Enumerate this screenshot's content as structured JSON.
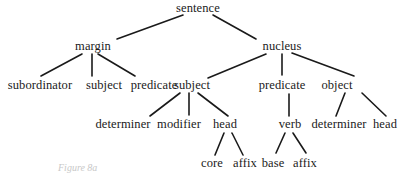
{
  "diagram": {
    "type": "tree",
    "nodes": [
      {
        "id": "n0",
        "label": "sentence",
        "x": 198,
        "y": 8
      },
      {
        "id": "n1",
        "label": "margin",
        "x": 93,
        "y": 46
      },
      {
        "id": "n2",
        "label": "nucleus",
        "x": 282,
        "y": 46
      },
      {
        "id": "n3",
        "label": "subordinator",
        "x": 40,
        "y": 85
      },
      {
        "id": "n4",
        "label": "subject",
        "x": 104,
        "y": 85
      },
      {
        "id": "n5",
        "label": "predicate",
        "x": 154,
        "y": 85
      },
      {
        "id": "n6",
        "label": "subject",
        "x": 192,
        "y": 85
      },
      {
        "id": "n7",
        "label": "predicate",
        "x": 282,
        "y": 85
      },
      {
        "id": "n8",
        "label": "object",
        "x": 337,
        "y": 85
      },
      {
        "id": "n9",
        "label": "determiner",
        "x": 123,
        "y": 124
      },
      {
        "id": "n10",
        "label": "modifier",
        "x": 179,
        "y": 124
      },
      {
        "id": "n11",
        "label": "head",
        "x": 225,
        "y": 124
      },
      {
        "id": "n12",
        "label": "verb",
        "x": 290,
        "y": 124
      },
      {
        "id": "n13",
        "label": "determiner",
        "x": 339,
        "y": 124
      },
      {
        "id": "n14",
        "label": "head",
        "x": 385,
        "y": 124
      },
      {
        "id": "n15",
        "label": "core",
        "x": 212,
        "y": 163
      },
      {
        "id": "n16",
        "label": "affix",
        "x": 245,
        "y": 163
      },
      {
        "id": "n17",
        "label": "base",
        "x": 273,
        "y": 163
      },
      {
        "id": "n18",
        "label": "affix",
        "x": 305,
        "y": 163
      }
    ],
    "edges": [
      {
        "from": "n0",
        "to": "n1",
        "x1": 183,
        "y1": 15,
        "x2": 117,
        "y2": 39
      },
      {
        "from": "n0",
        "to": "n2",
        "x1": 213,
        "y1": 15,
        "x2": 256,
        "y2": 39
      },
      {
        "from": "n1",
        "to": "n3",
        "x1": 82,
        "y1": 54,
        "x2": 41,
        "y2": 76
      },
      {
        "from": "n1",
        "to": "n4",
        "x1": 92,
        "y1": 54,
        "x2": 92,
        "y2": 76
      },
      {
        "from": "n1",
        "to": "n5",
        "x1": 98,
        "y1": 54,
        "x2": 135,
        "y2": 76
      },
      {
        "from": "n2",
        "to": "n6",
        "x1": 266,
        "y1": 54,
        "x2": 208,
        "y2": 78
      },
      {
        "from": "n2",
        "to": "n7",
        "x1": 282,
        "y1": 54,
        "x2": 282,
        "y2": 75
      },
      {
        "from": "n2",
        "to": "n8",
        "x1": 292,
        "y1": 53,
        "x2": 354,
        "y2": 76
      },
      {
        "from": "n6",
        "to": "n9",
        "x1": 180,
        "y1": 93,
        "x2": 150,
        "y2": 116
      },
      {
        "from": "n6",
        "to": "n10",
        "x1": 189,
        "y1": 93,
        "x2": 189,
        "y2": 115
      },
      {
        "from": "n6",
        "to": "n11",
        "x1": 198,
        "y1": 93,
        "x2": 228,
        "y2": 116
      },
      {
        "from": "n7",
        "to": "n12",
        "x1": 289,
        "y1": 94,
        "x2": 289,
        "y2": 116
      },
      {
        "from": "n8",
        "to": "n13",
        "x1": 345,
        "y1": 93,
        "x2": 336,
        "y2": 116
      },
      {
        "from": "n8",
        "to": "n14",
        "x1": 362,
        "y1": 93,
        "x2": 386,
        "y2": 116
      },
      {
        "from": "n11",
        "to": "n15",
        "x1": 224,
        "y1": 133,
        "x2": 215,
        "y2": 155
      },
      {
        "from": "n11",
        "to": "n16",
        "x1": 232,
        "y1": 133,
        "x2": 243,
        "y2": 155
      },
      {
        "from": "n12",
        "to": "n17",
        "x1": 285,
        "y1": 133,
        "x2": 276,
        "y2": 153
      },
      {
        "from": "n12",
        "to": "n18",
        "x1": 293,
        "y1": 133,
        "x2": 306,
        "y2": 153
      }
    ],
    "caption": "Figure 8a"
  }
}
